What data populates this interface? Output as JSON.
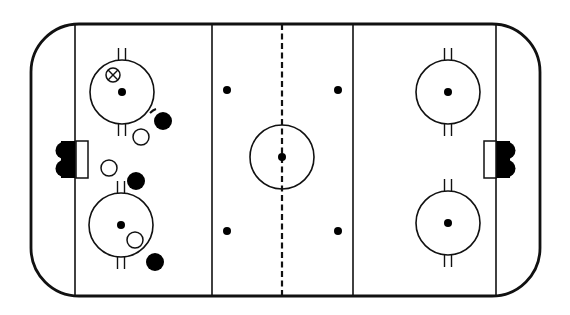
{
  "diagram": {
    "type": "hockey-rink-play-diagram",
    "colors": {
      "line": "#111111",
      "background": "#ffffff",
      "team_dark": "#000000",
      "team_light": "#ffffff"
    },
    "rink": {
      "x": 31,
      "y": 24,
      "width": 509,
      "height": 272,
      "corner_radius": 48
    },
    "lines": {
      "goal_left_x": 75,
      "goal_right_x": 496,
      "blue_left_x": 212,
      "blue_right_x": 353,
      "center_x": 282
    },
    "creases": [
      {
        "side": "left",
        "x": 76,
        "y": 141,
        "w": 12,
        "h": 37
      },
      {
        "side": "right",
        "x": 484,
        "y": 141,
        "w": 12,
        "h": 37
      }
    ],
    "faceoff_circles": [
      {
        "id": "left-top",
        "cx": 122,
        "cy": 92,
        "r": 32
      },
      {
        "id": "left-bottom",
        "cx": 121,
        "cy": 225,
        "r": 32
      },
      {
        "id": "center",
        "cx": 282,
        "cy": 157,
        "r": 32
      },
      {
        "id": "right-top",
        "cx": 448,
        "cy": 92,
        "r": 32
      },
      {
        "id": "right-bottom",
        "cx": 448,
        "cy": 223,
        "r": 32
      }
    ],
    "faceoff_dots": [
      {
        "cx": 122,
        "cy": 92
      },
      {
        "cx": 121,
        "cy": 225
      },
      {
        "cx": 282,
        "cy": 157
      },
      {
        "cx": 448,
        "cy": 92
      },
      {
        "cx": 448,
        "cy": 223
      },
      {
        "cx": 227,
        "cy": 90
      },
      {
        "cx": 338,
        "cy": 90
      },
      {
        "cx": 227,
        "cy": 231
      },
      {
        "cx": 338,
        "cy": 231
      }
    ],
    "players": [
      {
        "id": "x-marker",
        "kind": "crossed-circle",
        "cx": 113,
        "cy": 75,
        "r": 7
      },
      {
        "id": "dark-1",
        "kind": "filled",
        "cx": 163,
        "cy": 121,
        "r": 9
      },
      {
        "id": "light-1",
        "kind": "open",
        "cx": 141,
        "cy": 137,
        "r": 8
      },
      {
        "id": "light-2",
        "kind": "open",
        "cx": 109,
        "cy": 168,
        "r": 8
      },
      {
        "id": "dark-2",
        "kind": "filled",
        "cx": 136,
        "cy": 181,
        "r": 9
      },
      {
        "id": "light-3",
        "kind": "open",
        "cx": 135,
        "cy": 240,
        "r": 8
      },
      {
        "id": "dark-3",
        "kind": "filled",
        "cx": 155,
        "cy": 262,
        "r": 9
      }
    ],
    "puck": {
      "cx": 153,
      "cy": 110
    }
  }
}
